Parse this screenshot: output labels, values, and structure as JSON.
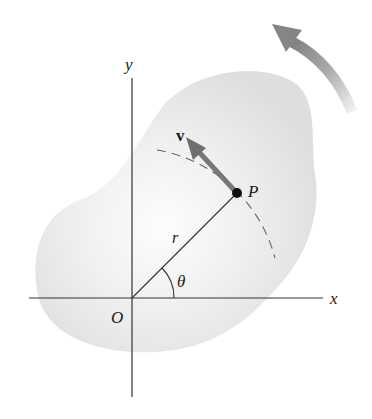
{
  "diagram": {
    "labels": {
      "y_axis": "y",
      "x_axis": "x",
      "origin": "O",
      "point": "P",
      "velocity": "v",
      "radius": "r",
      "angle": "θ"
    },
    "colors": {
      "body_fill": "#e4e4e4",
      "body_highlight": "#fbfbfb",
      "axis": "#333333",
      "velocity_arrow": "#777777",
      "rotation_arrow": "#8a8a8a",
      "point": "#111111"
    },
    "geometry": {
      "origin": [
        132,
        298
      ],
      "point_P": [
        237,
        193
      ],
      "velocity_tip": [
        186,
        138
      ],
      "rotation_direction": "counterclockwise"
    }
  }
}
